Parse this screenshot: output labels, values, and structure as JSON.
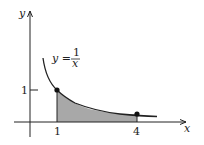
{
  "axes": {
    "x_label": "x",
    "y_label": "y"
  },
  "curve": {
    "equation_lhs": "y =",
    "fraction_numerator": "1",
    "fraction_denominator": "x"
  },
  "ticks": {
    "x_tick_1": "1",
    "x_tick_4": "4",
    "y_tick_1": "1"
  },
  "points": [
    {
      "x": 1,
      "y": 1
    },
    {
      "x": 4,
      "y": 0.25
    }
  ],
  "shaded_region": {
    "from": 1,
    "to": 4
  },
  "colors": {
    "fill": "#a8a8a8",
    "stroke": "#222222"
  }
}
